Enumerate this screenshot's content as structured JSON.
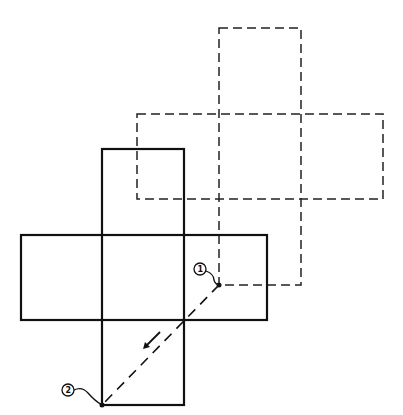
{
  "diagram": {
    "title": "",
    "colors": {
      "line": "#111111",
      "background": "#ffffff"
    },
    "solid_net": {
      "style": "solid",
      "column": {
        "x": 102,
        "w": 82,
        "y_top": 149,
        "y_bottom": 405
      },
      "row": {
        "x_left": 21,
        "x_right": 267,
        "y_top": 235,
        "y_bottom": 320
      }
    },
    "dashed_net": {
      "style": "dashed",
      "column": {
        "x": 219,
        "w": 82,
        "y_top": 28,
        "y_bottom": 285
      },
      "row": {
        "x_left": 137,
        "x_right": 383,
        "y_top": 114,
        "y_bottom": 199
      }
    },
    "points": [
      {
        "label": "1",
        "x": 219,
        "y": 285,
        "label_x": 201,
        "label_y": 269
      },
      {
        "label": "2",
        "x": 102,
        "y": 405,
        "label_x": 68,
        "label_y": 389
      }
    ],
    "translation_arrow": {
      "direction": "down-left",
      "from": "1",
      "to": "2"
    }
  }
}
